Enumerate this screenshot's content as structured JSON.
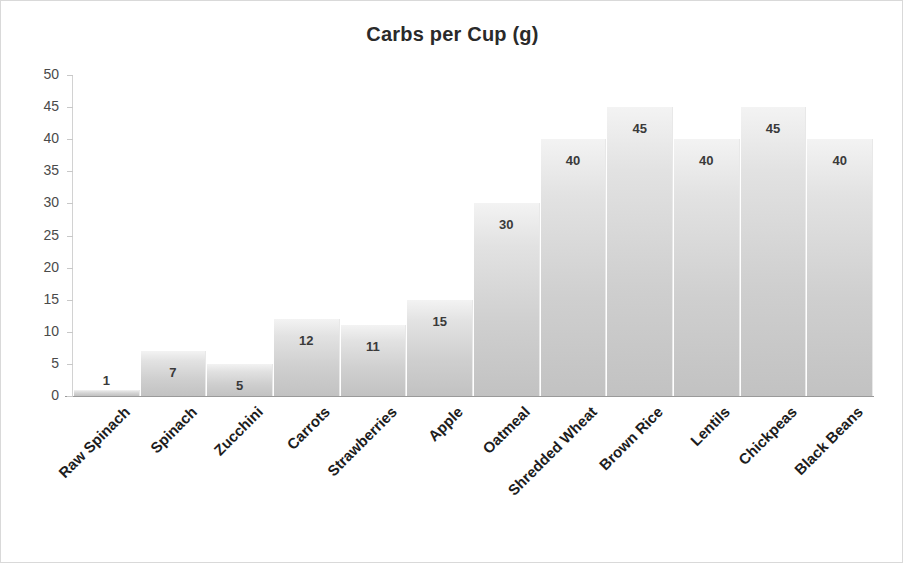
{
  "chart_data": {
    "type": "bar",
    "title": "Carbs per Cup (g)",
    "xlabel": "",
    "ylabel": "",
    "ylim": [
      0,
      50
    ],
    "ytick_step": 5,
    "yticks": [
      50,
      45,
      40,
      35,
      30,
      25,
      20,
      15,
      10,
      5,
      0
    ],
    "grid": false,
    "legend": "none",
    "data_labels": true,
    "categories": [
      "Raw Spinach",
      "Spinach",
      "Zucchini",
      "Carrots",
      "Strawberries",
      "Apple",
      "Oatmeal",
      "Shredded Wheat",
      "Brown Rice",
      "Lentils",
      "Chickpeas",
      "Black Beans"
    ],
    "values": [
      1,
      7,
      5,
      12,
      11,
      15,
      30,
      40,
      45,
      40,
      45,
      40
    ],
    "bar_color_top": "#f3f3f3",
    "bar_color_bottom": "#c2c2c2",
    "axis_color": "#9a9a9a",
    "text_color": "#1d1d1d"
  }
}
